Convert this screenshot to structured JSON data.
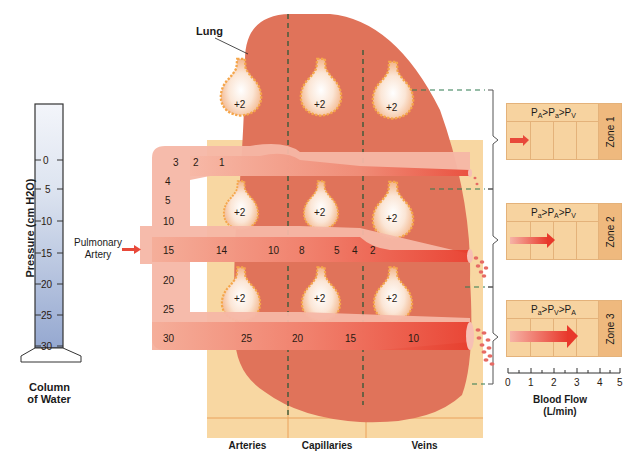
{
  "column": {
    "axis_label": "Pressure (cm H2O)",
    "ticks": [
      "0",
      "5",
      "10",
      "15",
      "20",
      "25",
      "30"
    ],
    "caption_line1": "Column",
    "caption_line2": "of Water"
  },
  "lung_label": "Lung",
  "pulmonary_artery": {
    "line1": "Pulmonary",
    "line2": "Artery"
  },
  "artery_pressures": {
    "top_branch": [
      "3",
      "2",
      "1"
    ],
    "left_stem": [
      "4",
      "5",
      "10",
      "15",
      "20",
      "25",
      "30"
    ],
    "middle_branch": [
      "14",
      "10",
      "8",
      "5",
      "4",
      "2"
    ],
    "bottom_branch": [
      "25",
      "20",
      "15",
      "10"
    ]
  },
  "alveoli_label": "+2",
  "regions": [
    "Arteries",
    "Capillaries",
    "Veins"
  ],
  "zones": [
    {
      "name": "Zone 1",
      "condition_html": [
        "P",
        "A",
        ">P",
        "a",
        ">P",
        "V"
      ],
      "flow": 0.4
    },
    {
      "name": "Zone 2",
      "condition_html": [
        "P",
        "a",
        ">P",
        "A",
        ">P",
        "V"
      ],
      "flow": 1.8
    },
    {
      "name": "Zone 3",
      "condition_html": [
        "P",
        "a",
        ">P",
        "V",
        ">P",
        "A"
      ],
      "flow": 3.0
    }
  ],
  "flow_axis": {
    "ticks": [
      "0",
      "1",
      "2",
      "3",
      "4",
      "5"
    ],
    "label_line1": "Blood Flow",
    "label_line2": "(L/min)"
  },
  "colors": {
    "lung": "#e0735a",
    "vessel": "#f2a08a",
    "vessel_dark": "#e9483a",
    "region_bg": "#f8d7a2",
    "column_water": "#9fb1d4",
    "dash": "#2f6b43"
  }
}
